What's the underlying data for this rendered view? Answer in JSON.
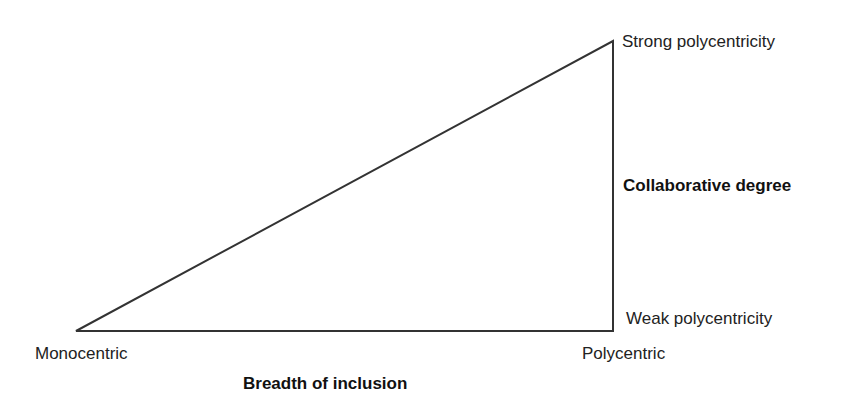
{
  "diagram": {
    "type": "triangle",
    "vertices": {
      "left": {
        "label": "Monocentric"
      },
      "bottom_right": {
        "label": "Polycentric"
      },
      "top_right": {
        "label": "Strong polycentricity"
      }
    },
    "labels": {
      "top_right": "Strong polycentricity",
      "vertical_axis": "Collaborative degree",
      "bottom_right_side": "Weak polycentricity",
      "left_vertex": "Monocentric",
      "right_vertex": "Polycentric",
      "horizontal_axis": "Breadth of inclusion"
    },
    "line_color": "#333333"
  }
}
